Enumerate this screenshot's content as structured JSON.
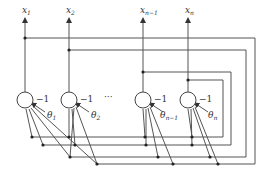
{
  "diagram": {
    "type": "recurrent-neural-network (Hopfield)",
    "outputs": [
      {
        "label": "x",
        "sub": "1"
      },
      {
        "label": "x",
        "sub": "2"
      },
      {
        "label": "x",
        "sub": "n−1"
      },
      {
        "label": "x",
        "sub": "n"
      }
    ],
    "neurons": [
      {
        "bias_weight": "−1",
        "threshold": "θ",
        "threshold_sub": "1"
      },
      {
        "bias_weight": "−1",
        "threshold": "θ",
        "threshold_sub": "2"
      },
      {
        "bias_weight": "−1",
        "threshold": "θ",
        "threshold_sub": "n−1"
      },
      {
        "bias_weight": "−1",
        "threshold": "θ",
        "threshold_sub": "n"
      }
    ],
    "ellipsis": "···",
    "colors": {
      "line": "#555555",
      "dot": "#222222",
      "background": "#ffffff"
    }
  }
}
